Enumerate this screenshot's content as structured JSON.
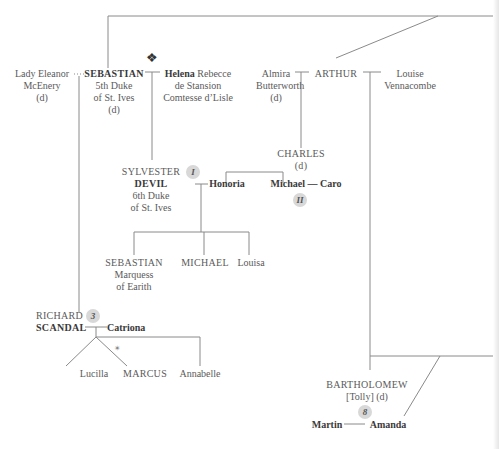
{
  "diagram": {
    "type": "family-tree",
    "people": {
      "eleanor": {
        "lines": [
          "Lady Eleanor",
          "McEnery",
          "(d)"
        ]
      },
      "sebastian5": {
        "name": "SEBASTIAN",
        "lines": [
          "5th Duke",
          "of St. Ives",
          "(d)"
        ]
      },
      "helena": {
        "name": "Helena",
        "lines": [
          "Rebecce",
          "de Stansion",
          "Comtesse d’Lisle"
        ]
      },
      "almira": {
        "lines": [
          "Almira",
          "Butterworth",
          "(d)"
        ]
      },
      "arthur": {
        "name": "ARTHUR"
      },
      "louise": {
        "lines": [
          "Louise",
          "Vennacombe"
        ]
      },
      "sylvester": {
        "line1": "SYLVESTER",
        "line2": "DEVIL",
        "lines": [
          "6th Duke",
          "of St. Ives"
        ],
        "badge": "I"
      },
      "charles": {
        "name": "CHARLES",
        "note": "(d)"
      },
      "honoria": {
        "name": "Honoria"
      },
      "michael_caro": {
        "name1": "Michael",
        "sep": "—",
        "name2": "Caro",
        "badge": "II"
      },
      "sebastian_marquess": {
        "name": "SEBASTIAN",
        "lines": [
          "Marquess",
          "of Earith"
        ]
      },
      "michael": {
        "name": "MICHAEL"
      },
      "louisa": {
        "name": "Louisa"
      },
      "richard": {
        "line1": "RICHARD",
        "line2": "SCANDAL",
        "badge": "3"
      },
      "catriona": {
        "name": "Catriona"
      },
      "lucilla": {
        "name": "Lucilla"
      },
      "marcus": {
        "name": "MARCUS"
      },
      "annabelle": {
        "name": "Annabelle"
      },
      "bartholomew": {
        "name": "BARTHOLOMEW",
        "note": "[Tolly] (d)"
      },
      "martin": {
        "name": "Martin"
      },
      "amanda": {
        "name": "Amanda",
        "badge": "8"
      }
    },
    "symbols": {
      "ornament": "❖",
      "twins_mark": "✴"
    }
  }
}
